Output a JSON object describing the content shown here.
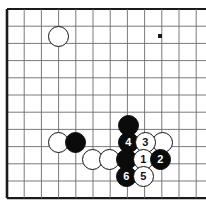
{
  "board": {
    "kind": "go-board-diagram",
    "background_color": "#ffffff",
    "line_color": "#6b6b6b",
    "edge_color": "#1a1a1a",
    "black_color": "#0b0b0b",
    "white_color": "#ffffff",
    "cell_size": 17.2,
    "origin_x": 7,
    "origin_y": 9,
    "cols": 12,
    "rows": 11,
    "edges": [
      "left",
      "top",
      "bottom"
    ],
    "star_points": [
      {
        "cx": 57.5,
        "cy": 142
      },
      {
        "cx": 160,
        "cy": 142
      },
      {
        "cx": 160,
        "cy": 36
      }
    ],
    "stones": [
      {
        "id": "w-top-left",
        "color": "white",
        "cx": 58,
        "cy": 36,
        "r": 10.5,
        "label": ""
      },
      {
        "id": "w-left-edge",
        "color": "white",
        "cx": 58,
        "cy": 142,
        "r": 10.5,
        "label": ""
      },
      {
        "id": "b-left",
        "color": "black",
        "cx": 75,
        "cy": 142,
        "r": 10.5,
        "label": ""
      },
      {
        "id": "b-upper",
        "color": "black",
        "cx": 128,
        "cy": 125,
        "r": 10.5,
        "label": ""
      },
      {
        "id": "w-right-edge",
        "color": "white",
        "cx": 162,
        "cy": 142,
        "r": 10.5,
        "label": ""
      },
      {
        "id": "w-under-left-a",
        "color": "white",
        "cx": 92,
        "cy": 159,
        "r": 10.5,
        "label": ""
      },
      {
        "id": "w-under-left-b",
        "color": "white",
        "cx": 109,
        "cy": 159,
        "r": 10.5,
        "label": ""
      },
      {
        "id": "b-center-low",
        "color": "black",
        "cx": 126,
        "cy": 159,
        "r": 10.5,
        "label": ""
      },
      {
        "id": "move-4",
        "color": "black",
        "cx": 128,
        "cy": 142,
        "r": 10.5,
        "label": "4"
      },
      {
        "id": "move-3",
        "color": "white",
        "cx": 145,
        "cy": 142,
        "r": 10.5,
        "label": "3"
      },
      {
        "id": "move-1",
        "color": "white",
        "cx": 143,
        "cy": 159,
        "r": 10.5,
        "label": "1"
      },
      {
        "id": "move-2",
        "color": "black",
        "cx": 160,
        "cy": 159,
        "r": 10.5,
        "label": "2"
      },
      {
        "id": "move-6",
        "color": "black",
        "cx": 126,
        "cy": 176,
        "r": 10.5,
        "label": "6"
      },
      {
        "id": "move-5",
        "color": "white",
        "cx": 143,
        "cy": 176,
        "r": 10.5,
        "label": "5"
      }
    ]
  }
}
